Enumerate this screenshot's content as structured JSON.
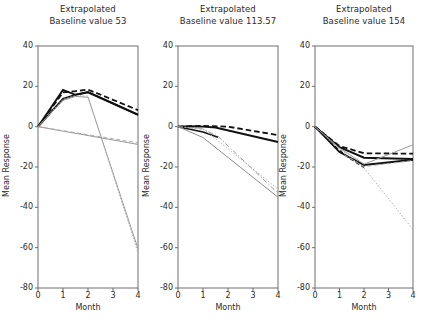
{
  "figure": {
    "width": 423,
    "height": 320,
    "background": "#ffffff",
    "panel_count": 3
  },
  "chart_data": {
    "type": "line",
    "title": "",
    "xlabel": "Month",
    "ylabel": "Mean Response",
    "xlim": [
      0,
      4
    ],
    "ylim": [
      -80,
      40
    ],
    "xticks": [
      0,
      1,
      2,
      3,
      4
    ],
    "yticks": [
      40,
      20,
      0,
      -20,
      -40,
      -60,
      -80
    ],
    "xtick_labels": [
      "0",
      "1",
      "2",
      "3",
      "4"
    ],
    "ytick_labels": [
      "40",
      "20",
      "0",
      "-20",
      "-40",
      "-60",
      "-80"
    ],
    "grid": false,
    "legend": "none",
    "panels": [
      {
        "id": "panel-1",
        "title_line1": "Extrapolated",
        "title_line2": "Baseline value 53",
        "baseline_value": 53,
        "xlabel": "Month",
        "ylabel": "Mean Response",
        "series": [
          {
            "name": "observed-solid-thick",
            "style": "solid",
            "color": "#111111",
            "width": 1.9,
            "x": [
              0,
              1,
              1.5,
              2,
              4
            ],
            "values": [
              0,
              18.2,
              15.8,
              17.2,
              6.0
            ]
          },
          {
            "name": "observed-solid-thick-lower",
            "style": "solid",
            "color": "#111111",
            "width": 1.9,
            "x": [
              0,
              1,
              1.5,
              2,
              4
            ],
            "values": [
              0,
              13.8,
              15.8,
              17.0,
              5.8
            ]
          },
          {
            "name": "model-dashed",
            "style": "dashed",
            "color": "#111111",
            "width": 1.8,
            "x": [
              0,
              1,
              1.5,
              2,
              4
            ],
            "values": [
              0,
              17.0,
              17.6,
              18.4,
              8.2
            ]
          },
          {
            "name": "extrapolated-gray-steep",
            "style": "solid",
            "color": "#999999",
            "width": 1.0,
            "x": [
              0,
              1,
              1.5,
              2,
              4
            ],
            "values": [
              0,
              13.0,
              15.0,
              14.6,
              -60.5
            ]
          },
          {
            "name": "extrapolated-gray-steep-dotted",
            "style": "dotted",
            "color": "#aaaaaa",
            "width": 1.0,
            "x": [
              0,
              1,
              1.5,
              2,
              4
            ],
            "values": [
              0,
              13.6,
              15.4,
              15.2,
              -62.5
            ]
          },
          {
            "name": "extrapolated-gray-shallow",
            "style": "solid",
            "color": "#8c8c8c",
            "width": 0.9,
            "x": [
              0,
              4
            ],
            "values": [
              0,
              -8.8
            ]
          },
          {
            "name": "extrapolated-gray-shallow-dashed",
            "style": "dashed",
            "color": "#a6a6a6",
            "width": 0.9,
            "x": [
              0,
              4
            ],
            "values": [
              0,
              -8.0
            ]
          }
        ]
      },
      {
        "id": "panel-2",
        "title_line1": "Extrapolated",
        "title_line2": "Baseline value 113.57",
        "baseline_value": 113.57,
        "xlabel": "Month",
        "ylabel": "Mean Response",
        "series": [
          {
            "name": "observed-solid-thick",
            "style": "solid",
            "color": "#111111",
            "width": 1.9,
            "x": [
              0,
              0.5,
              1,
              1.5,
              4
            ],
            "values": [
              0,
              0.2,
              0.0,
              -0.4,
              -7.6
            ]
          },
          {
            "name": "observed-solid-steeper",
            "style": "solid",
            "color": "#111111",
            "width": 1.6,
            "x": [
              0,
              1,
              1.6
            ],
            "values": [
              0,
              -2.6,
              -5.2
            ]
          },
          {
            "name": "model-dashed",
            "style": "dashed",
            "color": "#111111",
            "width": 1.8,
            "x": [
              0,
              1,
              2,
              4
            ],
            "values": [
              0,
              0.4,
              0.0,
              -4.2
            ]
          },
          {
            "name": "extrapolated-gray-dashdot",
            "style": "dashdot",
            "color": "#9a9a9a",
            "width": 1.0,
            "x": [
              0,
              1,
              1.6,
              4
            ],
            "values": [
              0,
              -1.2,
              -4.8,
              -33.0
            ]
          },
          {
            "name": "extrapolated-gray-dotted",
            "style": "dotted",
            "color": "#aaaaaa",
            "width": 1.0,
            "x": [
              0,
              1,
              4
            ],
            "values": [
              0,
              -1.0,
              -31.0
            ]
          },
          {
            "name": "extrapolated-gray-solid",
            "style": "solid",
            "color": "#8c8c8c",
            "width": 1.0,
            "x": [
              0,
              1,
              4
            ],
            "values": [
              0,
              -5.4,
              -35.0
            ]
          }
        ]
      },
      {
        "id": "panel-3",
        "title_line1": "Extrapolated",
        "title_line2": "Baseline value 154",
        "baseline_value": 154,
        "xlabel": "Month",
        "ylabel": "Mean Response",
        "series": [
          {
            "name": "observed-solid-upper",
            "style": "solid",
            "color": "#111111",
            "width": 1.9,
            "x": [
              0,
              1,
              2,
              4
            ],
            "values": [
              0,
              -10.2,
              -15.4,
              -16.0
            ]
          },
          {
            "name": "observed-solid-lower",
            "style": "solid",
            "color": "#111111",
            "width": 1.9,
            "x": [
              0,
              1,
              2,
              4
            ],
            "values": [
              0,
              -12.6,
              -19.0,
              -16.4
            ]
          },
          {
            "name": "model-dashed-upper",
            "style": "dashed",
            "color": "#111111",
            "width": 1.8,
            "x": [
              0,
              1,
              2,
              4
            ],
            "values": [
              0,
              -9.6,
              -13.2,
              -13.4
            ]
          },
          {
            "name": "model-dashed-lower",
            "style": "dashed",
            "color": "#111111",
            "width": 1.4,
            "x": [
              0.6,
              1.3,
              2.0
            ],
            "values": [
              -7.6,
              -14.8,
              -20.2
            ]
          },
          {
            "name": "extrapolated-gray-steep",
            "style": "dotted",
            "color": "#b0b0b0",
            "width": 1.0,
            "x": [
              0,
              1,
              2,
              4
            ],
            "values": [
              0,
              -11.0,
              -20.4,
              -51.0
            ]
          },
          {
            "name": "extrapolated-gray-rising",
            "style": "solid",
            "color": "#9a9a9a",
            "width": 1.0,
            "x": [
              0,
              1,
              2,
              4
            ],
            "values": [
              0,
              -10.6,
              -18.6,
              -9.0
            ]
          },
          {
            "name": "extrapolated-gray-dashed-flat",
            "style": "dashed",
            "color": "#a8a8a8",
            "width": 1.0,
            "x": [
              1.2,
              2,
              4
            ],
            "values": [
              -14.0,
              -19.8,
              -16.8
            ]
          }
        ]
      }
    ]
  }
}
